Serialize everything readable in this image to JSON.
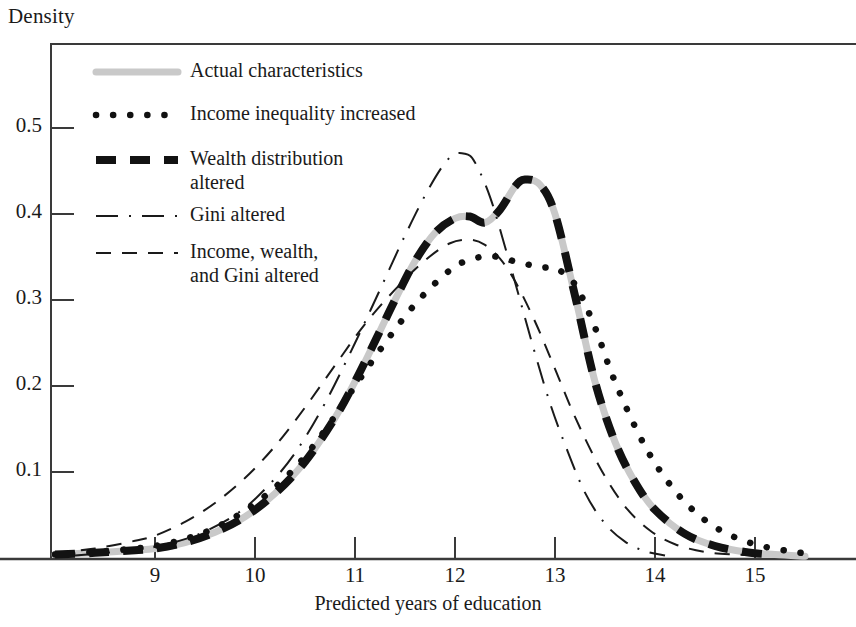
{
  "chart_data": {
    "type": "line",
    "title": "",
    "ylabel": "Density",
    "xlabel": "Predicted years of education",
    "grid": false,
    "legend_position": "inside-top-left",
    "xlim": [
      8.0,
      15.6
    ],
    "ylim": [
      0.0,
      0.58
    ],
    "xticks": [
      9,
      10,
      11,
      12,
      13,
      14,
      15
    ],
    "xtick_labels": [
      "9",
      "10",
      "11",
      "12",
      "13",
      "14",
      "15"
    ],
    "yticks": [
      0.1,
      0.2,
      0.3,
      0.4,
      0.5
    ],
    "ytick_labels": [
      "0.1",
      "0.2",
      "0.3",
      "0.4",
      "0.5"
    ],
    "series": [
      {
        "name": "Actual characteristics",
        "style": "solid-light",
        "color": "#c9c9c9",
        "x": [
          8.0,
          8.4,
          8.8,
          9.0,
          9.3,
          9.6,
          9.9,
          10.2,
          10.5,
          10.8,
          11.0,
          11.2,
          11.4,
          11.6,
          11.8,
          12.0,
          12.15,
          12.3,
          12.45,
          12.6,
          12.7,
          12.85,
          13.0,
          13.2,
          13.4,
          13.6,
          13.8,
          14.0,
          14.3,
          14.6,
          14.9,
          15.2,
          15.5
        ],
        "y": [
          0.004,
          0.006,
          0.009,
          0.011,
          0.018,
          0.03,
          0.048,
          0.075,
          0.112,
          0.163,
          0.205,
          0.252,
          0.3,
          0.345,
          0.378,
          0.395,
          0.397,
          0.39,
          0.405,
          0.432,
          0.44,
          0.434,
          0.4,
          0.305,
          0.205,
          0.135,
          0.088,
          0.056,
          0.028,
          0.014,
          0.007,
          0.004,
          0.002
        ]
      },
      {
        "name": "Income inequality increased",
        "style": "dotted",
        "color": "#111111",
        "x": [
          8.0,
          8.4,
          8.8,
          9.0,
          9.3,
          9.6,
          9.9,
          10.2,
          10.5,
          10.8,
          11.0,
          11.3,
          11.6,
          11.9,
          12.1,
          12.35,
          12.6,
          12.85,
          13.0,
          13.2,
          13.4,
          13.6,
          13.9,
          14.2,
          14.5,
          14.8,
          15.1,
          15.4,
          15.55
        ],
        "y": [
          0.004,
          0.007,
          0.011,
          0.014,
          0.022,
          0.035,
          0.055,
          0.082,
          0.118,
          0.165,
          0.2,
          0.25,
          0.295,
          0.33,
          0.345,
          0.351,
          0.345,
          0.338,
          0.337,
          0.318,
          0.268,
          0.205,
          0.13,
          0.078,
          0.044,
          0.024,
          0.013,
          0.007,
          0.005
        ]
      },
      {
        "name": "Wealth distribution altered",
        "style": "thick-dashed",
        "color": "#121212",
        "x": [
          8.0,
          8.4,
          8.8,
          9.0,
          9.3,
          9.6,
          9.9,
          10.2,
          10.5,
          10.8,
          11.0,
          11.2,
          11.4,
          11.6,
          11.8,
          12.0,
          12.15,
          12.3,
          12.45,
          12.6,
          12.7,
          12.85,
          13.0,
          13.2,
          13.4,
          13.6,
          13.8,
          14.0,
          14.3,
          14.6,
          14.9,
          15.15
        ],
        "y": [
          0.004,
          0.006,
          0.009,
          0.011,
          0.018,
          0.03,
          0.048,
          0.075,
          0.112,
          0.163,
          0.205,
          0.252,
          0.3,
          0.345,
          0.378,
          0.395,
          0.397,
          0.39,
          0.405,
          0.432,
          0.44,
          0.434,
          0.4,
          0.305,
          0.205,
          0.135,
          0.088,
          0.056,
          0.028,
          0.014,
          0.007,
          0.004
        ]
      },
      {
        "name": "Gini altered",
        "style": "dash-dot",
        "color": "#1a1a1a",
        "x": [
          8.2,
          8.7,
          9.0,
          9.4,
          9.8,
          10.1,
          10.4,
          10.7,
          11.0,
          11.25,
          11.5,
          11.75,
          11.95,
          12.1,
          12.2,
          12.35,
          12.5,
          12.65,
          12.8,
          12.95,
          13.1,
          13.3,
          13.5,
          13.7,
          13.9,
          14.1
        ],
        "y": [
          0.003,
          0.008,
          0.013,
          0.026,
          0.05,
          0.08,
          0.122,
          0.18,
          0.25,
          0.312,
          0.375,
          0.432,
          0.466,
          0.47,
          0.46,
          0.42,
          0.362,
          0.3,
          0.238,
          0.18,
          0.132,
          0.076,
          0.04,
          0.019,
          0.008,
          0.003
        ]
      },
      {
        "name": "Income, wealth, and Gini altered",
        "style": "dashed",
        "color": "#1a1a1a",
        "x": [
          8.0,
          8.4,
          8.8,
          9.0,
          9.3,
          9.6,
          9.9,
          10.2,
          10.5,
          10.8,
          11.1,
          11.4,
          11.7,
          11.95,
          12.15,
          12.3,
          12.45,
          12.6,
          12.8,
          13.0,
          13.2,
          13.45,
          13.7,
          13.95,
          14.2,
          14.5,
          14.8,
          15.05
        ],
        "y": [
          0.006,
          0.011,
          0.02,
          0.026,
          0.042,
          0.064,
          0.093,
          0.13,
          0.175,
          0.224,
          0.272,
          0.312,
          0.346,
          0.366,
          0.37,
          0.364,
          0.348,
          0.322,
          0.275,
          0.22,
          0.164,
          0.105,
          0.06,
          0.032,
          0.016,
          0.007,
          0.004,
          0.003
        ]
      }
    ]
  },
  "axes": {
    "ylabel": "Density",
    "xlabel": "Predicted years of education"
  },
  "legend": {
    "items": [
      {
        "label": "Actual characteristics",
        "swatch": "solid-light-swatch"
      },
      {
        "label": "Income inequality increased",
        "swatch": "dotted-swatch"
      },
      {
        "label": "Wealth distribution\naltered",
        "swatch": "thick-dashed-swatch"
      },
      {
        "label": "Gini altered",
        "swatch": "dash-dot-swatch"
      },
      {
        "label": "Income, wealth,\nand Gini altered",
        "swatch": "dashed-swatch"
      }
    ]
  },
  "colors": {
    "axis": "#2b2b2b",
    "actual": "#c9c9c9",
    "ink": "#121212",
    "background": "#ffffff"
  }
}
